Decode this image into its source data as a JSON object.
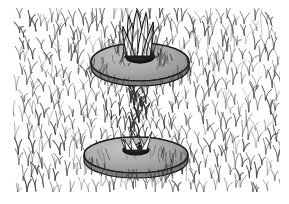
{
  "figure": {
    "title": "Grass field with two stacked disc collars",
    "kind": "line-drawing-illustration",
    "width": 289,
    "height": 204,
    "background_color": "#ffffff",
    "description": "Dense hatched field of vertical blade-like strokes with two gray elliptical discs stacked vertically at center; blades emerge through a dark hub at the center of each disc."
  },
  "canvas": {
    "texture_left": 14,
    "texture_top": 9,
    "texture_right": 279,
    "texture_bottom": 191,
    "margin_color": "#ffffff"
  },
  "palette": {
    "ink": "#2b2b2b",
    "ink_light": "#6a6a6a",
    "ink_mid": "#4a4a4a",
    "disc_fill": "#a9a9a9",
    "disc_fill_light": "#bdbdbd",
    "disc_edge": "#1a1a1a",
    "hub_dark": "#141414",
    "highlight": "#ffffff",
    "paper": "#ffffff"
  },
  "texture": {
    "name": "blade-hatching",
    "motif": "vertical chevron blades",
    "stroke_color": "#3a3a3a",
    "stroke_width": 0.8,
    "column_spacing": 9,
    "row_spacing": 13,
    "columns": 30,
    "rows": 15,
    "jitter": 3.2
  },
  "discs": [
    {
      "id": "upper-disc",
      "label": "Upper disc collar",
      "cx": 140,
      "cy": 62,
      "rx": 49,
      "ry": 19,
      "thickness": 6,
      "fill": "#a9a9a9",
      "edge": "#1a1a1a",
      "hub_rx": 14,
      "hub_ry": 6,
      "hub_fill": "#141414",
      "blade_count": 5
    },
    {
      "id": "lower-disc",
      "label": "Lower disc collar",
      "cx": 136,
      "cy": 155,
      "rx": 52,
      "ry": 18,
      "thickness": 6,
      "fill": "#a9a9a9",
      "edge": "#1a1a1a",
      "hub_rx": 13,
      "hub_ry": 5,
      "hub_fill": "#141414",
      "blade_count": 5
    }
  ],
  "stem_column": {
    "label": "Bundled blade column between discs",
    "cx": 138,
    "top": 78,
    "bottom": 148,
    "half_width": 36,
    "waist_half_width": 26
  },
  "crown": {
    "label": "Emerging blade crown above upper disc",
    "cx": 140,
    "base_y": 58,
    "tip_y": 10,
    "blades": [
      {
        "tip_x": 129,
        "tip_y": 16,
        "base_x": 134,
        "width": 5
      },
      {
        "tip_x": 137,
        "tip_y": 10,
        "base_x": 138,
        "width": 6
      },
      {
        "tip_x": 146,
        "tip_y": 13,
        "base_x": 142,
        "width": 5
      },
      {
        "tip_x": 153,
        "tip_y": 22,
        "base_x": 146,
        "width": 4
      },
      {
        "tip_x": 123,
        "tip_y": 26,
        "base_x": 131,
        "width": 4
      }
    ]
  },
  "annotations": {
    "has_text_labels": false,
    "has_axes": false,
    "has_legend": false,
    "has_border_frame": false
  }
}
